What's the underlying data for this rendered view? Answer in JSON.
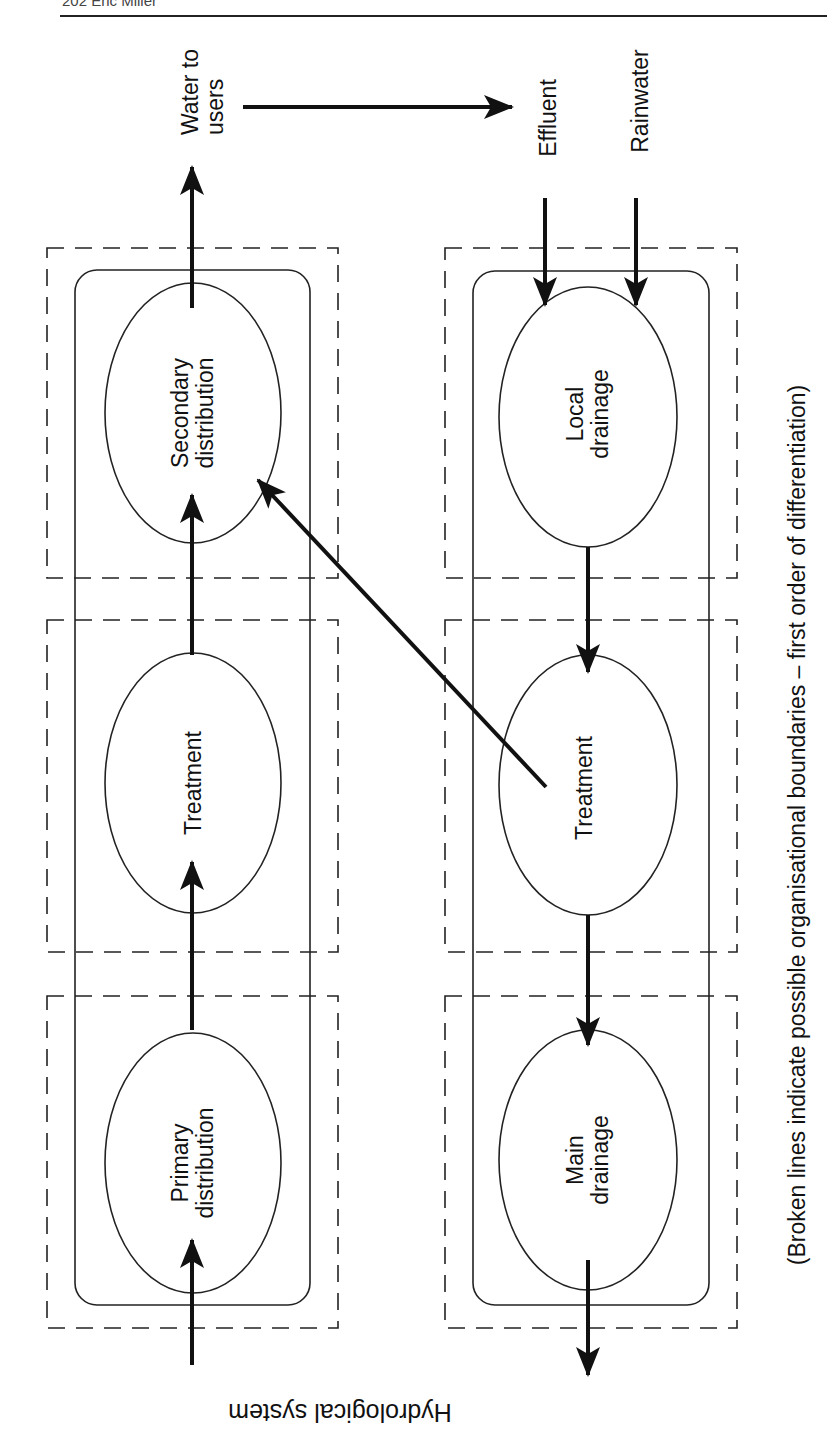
{
  "page_header": {
    "text": "202 Eric Miller"
  },
  "title": "Hydrological system",
  "caption": "(Broken lines indicate possible organisational boundaries – first order of differentiation)",
  "inputs": {
    "water_to_users": "Water to\nusers",
    "effluent": "Effluent",
    "rainwater": "Rainwater"
  },
  "supply_column": {
    "nodes": [
      {
        "id": "secondary",
        "label": "Secondary\ndistribution"
      },
      {
        "id": "treatment",
        "label": "Treatment"
      },
      {
        "id": "primary",
        "label": "Primary\ndistribution"
      }
    ]
  },
  "drainage_column": {
    "nodes": [
      {
        "id": "local",
        "label": "Local\ndrainage"
      },
      {
        "id": "treatment",
        "label": "Treatment"
      },
      {
        "id": "main",
        "label": "Main\ndrainage"
      }
    ]
  },
  "flows": [
    {
      "from": "external",
      "to": "Primary distribution"
    },
    {
      "from": "Primary distribution",
      "to": "Treatment"
    },
    {
      "from": "Treatment",
      "to": "Secondary distribution"
    },
    {
      "from": "Secondary distribution",
      "to": "Water to users"
    },
    {
      "from": "Water to users",
      "to": "Effluent"
    },
    {
      "from": "Effluent",
      "to": "Local drainage"
    },
    {
      "from": "Rainwater",
      "to": "Local drainage"
    },
    {
      "from": "Local drainage",
      "to": "Treatment (drainage)"
    },
    {
      "from": "Treatment (drainage)",
      "to": "Main drainage"
    },
    {
      "from": "Treatment (drainage)",
      "to": "Secondary distribution"
    },
    {
      "from": "Main drainage",
      "to": "external"
    }
  ],
  "colors": {
    "ink": "#111111",
    "background": "#ffffff"
  }
}
